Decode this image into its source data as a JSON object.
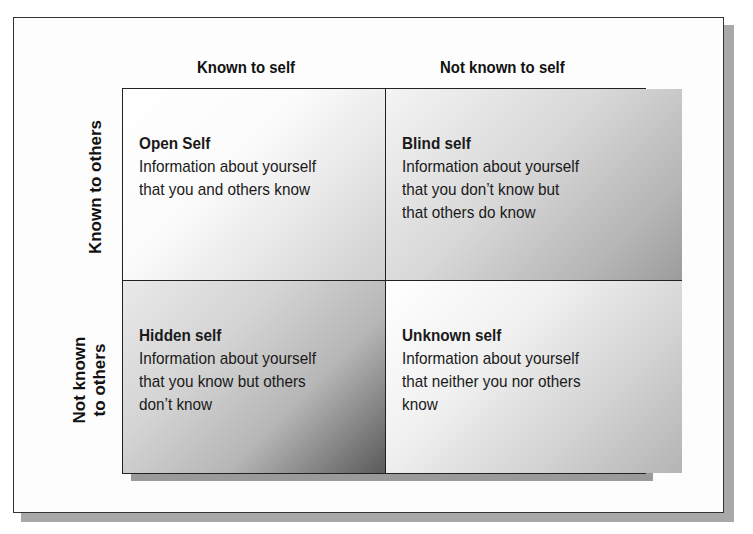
{
  "diagram": {
    "columns": [
      {
        "label": "Known to self"
      },
      {
        "label": "Not known to self"
      }
    ],
    "rows": [
      {
        "label": "Known to others"
      },
      {
        "label": "Not known\nto others"
      }
    ],
    "quadrants": [
      {
        "title": "Open Self",
        "description": "Information about yourself\nthat you and others know"
      },
      {
        "title": "Blind self",
        "description": "Information about yourself\nthat you don’t know but\nthat others do know"
      },
      {
        "title": "Hidden self",
        "description": "Information about yourself\nthat you know but others\ndon’t know"
      },
      {
        "title": "Unknown self",
        "description": "Information about yourself\nthat neither you nor others\nknow"
      }
    ],
    "colors": {
      "border": "#222222",
      "shadow": "#9a9a9a",
      "text": "#1a1a1a"
    }
  }
}
